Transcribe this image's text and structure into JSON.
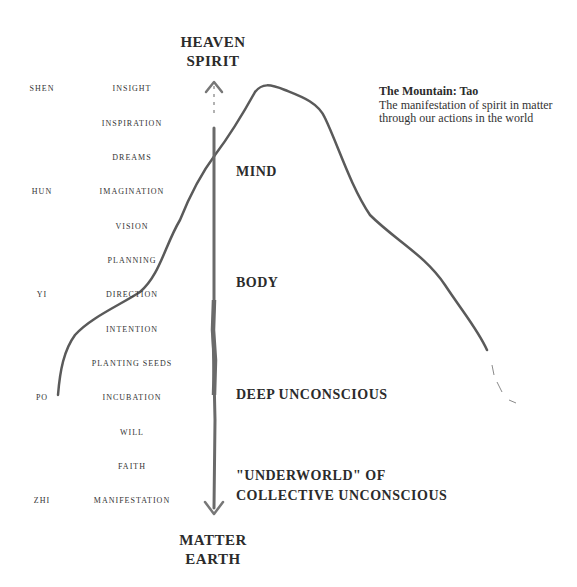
{
  "top_pole": {
    "line1": "HEAVEN",
    "line2": "SPIRIT"
  },
  "bottom_pole": {
    "line1": "MATTER",
    "line2": "EARTH"
  },
  "spirits": [
    {
      "label": "SHEN",
      "y": 88
    },
    {
      "label": "HUN",
      "y": 191
    },
    {
      "label": "YI",
      "y": 294
    },
    {
      "label": "PO",
      "y": 397
    },
    {
      "label": "ZHI",
      "y": 500
    }
  ],
  "stages": [
    {
      "label": "INSIGHT",
      "y": 88
    },
    {
      "label": "INSPIRATION",
      "y": 123
    },
    {
      "label": "DREAMS",
      "y": 157
    },
    {
      "label": "IMAGINATION",
      "y": 191
    },
    {
      "label": "VISION",
      "y": 226
    },
    {
      "label": "PLANNING",
      "y": 260
    },
    {
      "label": "DIRECTION",
      "y": 294
    },
    {
      "label": "INTENTION",
      "y": 329
    },
    {
      "label": "PLANTING SEEDS",
      "y": 363
    },
    {
      "label": "INCUBATION",
      "y": 397
    },
    {
      "label": "WILL",
      "y": 432
    },
    {
      "label": "FAITH",
      "y": 466
    },
    {
      "label": "MANIFESTATION",
      "y": 500
    }
  ],
  "layers": {
    "mind": "MIND",
    "body": "BODY",
    "deep_unconscious": "DEEP UNCONSCIOUS",
    "underworld_line1": "\"UNDERWORLD\" OF",
    "underworld_line2": "COLLECTIVE UNCONSCIOUS"
  },
  "legend": {
    "title": "The Mountain: Tao",
    "description": "The manifestation of spirit in matter through our actions in the world"
  },
  "colors": {
    "mountain_dark": "#7a7a7a",
    "mountain_light": "#ffffff",
    "outline": "#5a5a5a",
    "text": "#2b2b2b"
  }
}
